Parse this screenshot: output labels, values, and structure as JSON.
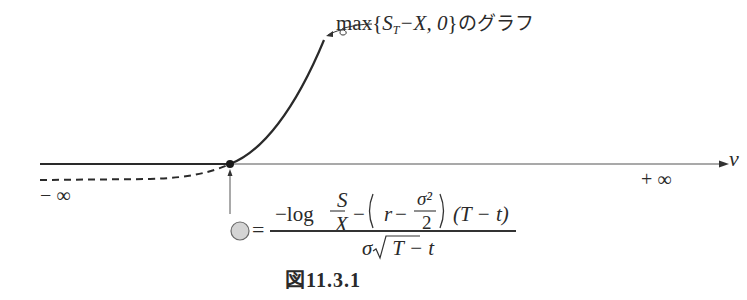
{
  "figure": {
    "caption": "図11.3.1",
    "curve_label": {
      "prefix": "max",
      "open_brace": "{",
      "S": "S",
      "sub_T": "T",
      "minus_X": "−X, 0",
      "close_brace": "}",
      "suffix": "のグラフ",
      "full_text": "max{S_T−X, 0}のグラフ"
    },
    "axis": {
      "variable": "v",
      "left_end_label": "− ∞",
      "right_end_label": "+ ∞"
    },
    "kink_point_formula": {
      "marker": "gray-circle",
      "equals": "=",
      "numerator": {
        "neg_log": "−log",
        "frac_top": "S",
        "frac_bottom": "X",
        "minus": "−",
        "paren_open": "(",
        "r": "r",
        "minus2": "−",
        "sigma_sq": "σ²",
        "two": "2",
        "paren_close": ")",
        "time_term": "(T − t)"
      },
      "denominator": {
        "sigma": "σ",
        "sqrt_content": "T − t"
      },
      "full_text": "= (−log(S/X) − (r − σ²/2)(T−t)) / (σ√(T−t))"
    },
    "colors": {
      "line": "#2a2a2a",
      "axis": "#555555",
      "marker_fill": "#d4d4d4",
      "marker_stroke": "#6a6a6a"
    }
  }
}
